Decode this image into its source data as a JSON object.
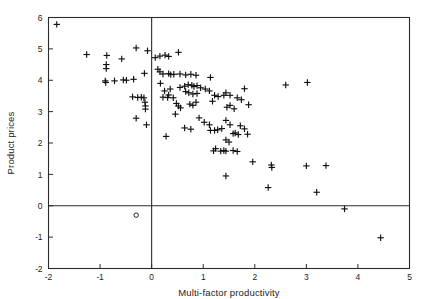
{
  "chart_data": {
    "type": "scatter",
    "title": "",
    "xlabel": "Multi-factor productivity",
    "ylabel": "Product prices",
    "xlim": [
      -2,
      5
    ],
    "ylim": [
      -2,
      6
    ],
    "xticks": [
      -2,
      -1,
      0,
      1,
      2,
      3,
      4,
      5
    ],
    "xtick_labels": [
      "-2",
      "-1",
      "0",
      "1",
      "2",
      "3",
      "4",
      "5"
    ],
    "yticks": [
      -2,
      -1,
      0,
      1,
      2,
      3,
      4,
      5,
      6
    ],
    "ytick_labels": [
      "-2",
      "-1",
      "0",
      "1",
      "2",
      "3",
      "4",
      "5",
      "6"
    ],
    "grid": false,
    "legend": false,
    "reference_lines": [
      {
        "axis": "y",
        "value": 0,
        "color": "#2b2b2b"
      },
      {
        "axis": "x",
        "value": 0,
        "color": "#2b2b2b"
      }
    ],
    "marker": "plus",
    "marker_color": "#111111",
    "series": [
      {
        "name": "observations",
        "marker": "plus",
        "points": [
          [
            -1.84,
            5.78
          ],
          [
            -1.26,
            4.82
          ],
          [
            -0.87,
            4.79
          ],
          [
            -0.88,
            4.5
          ],
          [
            -0.88,
            4.37
          ],
          [
            -0.58,
            4.68
          ],
          [
            -0.3,
            5.03
          ],
          [
            -0.9,
            3.98
          ],
          [
            -0.89,
            3.93
          ],
          [
            -0.72,
            3.98
          ],
          [
            -0.55,
            4.01
          ],
          [
            -0.49,
            4.0
          ],
          [
            -0.35,
            4.03
          ],
          [
            -0.37,
            3.47
          ],
          [
            -0.27,
            3.45
          ],
          [
            -0.2,
            3.46
          ],
          [
            -0.15,
            3.44
          ],
          [
            -0.13,
            3.3
          ],
          [
            -0.12,
            3.18
          ],
          [
            -0.12,
            3.08
          ],
          [
            -0.3,
            2.79
          ],
          [
            -0.1,
            2.58
          ],
          [
            -0.08,
            4.94
          ],
          [
            -0.14,
            4.22
          ],
          [
            0.07,
            4.72
          ],
          [
            0.16,
            4.77
          ],
          [
            0.26,
            4.8
          ],
          [
            0.33,
            4.76
          ],
          [
            0.52,
            4.89
          ],
          [
            0.12,
            4.35
          ],
          [
            0.16,
            4.27
          ],
          [
            0.22,
            4.2
          ],
          [
            0.33,
            4.21
          ],
          [
            0.37,
            4.18
          ],
          [
            0.43,
            4.19
          ],
          [
            0.55,
            4.2
          ],
          [
            0.66,
            4.17
          ],
          [
            0.76,
            4.19
          ],
          [
            0.86,
            4.16
          ],
          [
            1.14,
            4.09
          ],
          [
            0.17,
            3.9
          ],
          [
            0.25,
            3.66
          ],
          [
            0.36,
            3.72
          ],
          [
            0.33,
            3.53
          ],
          [
            0.22,
            3.46
          ],
          [
            0.31,
            3.45
          ],
          [
            0.42,
            3.44
          ],
          [
            0.55,
            3.77
          ],
          [
            0.64,
            3.81
          ],
          [
            0.71,
            3.86
          ],
          [
            0.78,
            3.84
          ],
          [
            0.82,
            3.8
          ],
          [
            0.88,
            3.83
          ],
          [
            0.95,
            3.76
          ],
          [
            0.66,
            3.64
          ],
          [
            0.72,
            3.6
          ],
          [
            0.8,
            3.56
          ],
          [
            0.88,
            3.58
          ],
          [
            1.04,
            3.72
          ],
          [
            1.12,
            3.66
          ],
          [
            1.22,
            3.52
          ],
          [
            0.48,
            3.26
          ],
          [
            0.52,
            3.18
          ],
          [
            0.56,
            3.12
          ],
          [
            0.46,
            2.92
          ],
          [
            0.74,
            3.24
          ],
          [
            0.8,
            3.2
          ],
          [
            0.86,
            3.3
          ],
          [
            1.18,
            3.33
          ],
          [
            1.29,
            3.48
          ],
          [
            1.4,
            3.52
          ],
          [
            1.46,
            3.14
          ],
          [
            1.52,
            3.2
          ],
          [
            1.6,
            3.09
          ],
          [
            1.66,
            3.44
          ],
          [
            1.74,
            3.38
          ],
          [
            1.8,
            3.73
          ],
          [
            1.88,
            3.22
          ],
          [
            1.44,
            3.6
          ],
          [
            1.52,
            3.52
          ],
          [
            0.28,
            2.21
          ],
          [
            0.64,
            2.48
          ],
          [
            0.76,
            2.44
          ],
          [
            0.92,
            2.8
          ],
          [
            1.02,
            2.66
          ],
          [
            1.12,
            2.58
          ],
          [
            1.14,
            2.4
          ],
          [
            1.22,
            2.4
          ],
          [
            1.28,
            2.42
          ],
          [
            1.36,
            2.46
          ],
          [
            1.44,
            2.72
          ],
          [
            1.52,
            2.58
          ],
          [
            1.58,
            2.3
          ],
          [
            1.62,
            2.32
          ],
          [
            1.68,
            2.27
          ],
          [
            1.72,
            2.55
          ],
          [
            1.8,
            2.45
          ],
          [
            1.86,
            2.28
          ],
          [
            1.44,
            2.1
          ],
          [
            1.5,
            2.03
          ],
          [
            1.2,
            1.75
          ],
          [
            1.24,
            1.82
          ],
          [
            1.34,
            1.74
          ],
          [
            1.4,
            1.76
          ],
          [
            1.44,
            1.74
          ],
          [
            1.58,
            1.76
          ],
          [
            1.66,
            1.73
          ],
          [
            1.44,
            0.95
          ],
          [
            1.96,
            1.4
          ],
          [
            2.32,
            1.3
          ],
          [
            2.33,
            1.22
          ],
          [
            2.26,
            0.58
          ],
          [
            2.6,
            3.85
          ],
          [
            3.02,
            3.93
          ],
          [
            3.0,
            1.27
          ],
          [
            3.38,
            1.28
          ],
          [
            3.2,
            0.43
          ],
          [
            3.74,
            -0.1
          ],
          [
            4.44,
            -1.02
          ]
        ]
      },
      {
        "name": "outlier",
        "marker": "circle",
        "points": [
          [
            -0.3,
            -0.3
          ]
        ]
      }
    ]
  },
  "figure": {
    "background": "#ffffff",
    "axis_color": "#2b2b2b"
  }
}
